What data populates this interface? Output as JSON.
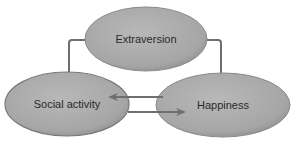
{
  "diagram": {
    "nodes": [
      {
        "id": "extraversion",
        "label": "Extraversion"
      },
      {
        "id": "social_activity",
        "label": "Social activity"
      },
      {
        "id": "happiness",
        "label": "Happiness"
      }
    ],
    "edges": [
      {
        "from": "extraversion",
        "to": "social_activity"
      },
      {
        "from": "extraversion",
        "to": "happiness"
      },
      {
        "from": "happiness",
        "to": "social_activity"
      },
      {
        "from": "social_activity",
        "to": "happiness"
      }
    ],
    "colors": {
      "node_fill": "#a9a9a9",
      "node_stroke": "#7a7a7a",
      "arrow": "#6e6e6e",
      "text": "#2a2a2a"
    }
  }
}
